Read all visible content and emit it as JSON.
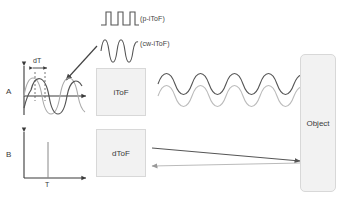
{
  "figure": {
    "type": "diagram",
    "background_color": "#ffffff"
  },
  "legend": {
    "pulsed_waveform_label": "(p-iToF)",
    "continuous_wave_label": "(cw-iToF)",
    "waveform_stroke": "#555555"
  },
  "panels": [
    {
      "id": "panel-a",
      "axis_label": "A",
      "annotation": "dT",
      "description": "Emitted and phase-shifted received sine waves",
      "emitted_stroke": "#aaaaaa",
      "received_stroke": "#555555"
    },
    {
      "id": "panel-b",
      "axis_label": "B",
      "annotation": "T",
      "description": "Single returned light pulse arriving after delay T",
      "impulse_stroke": "#888888"
    }
  ],
  "blocks": [
    {
      "id": "itof",
      "label": "iToF",
      "fill": "#f2f2f2",
      "border": "#d8d8d8"
    },
    {
      "id": "dtof",
      "label": "dToF",
      "fill": "#f2f2f2",
      "border": "#d8d8d8"
    },
    {
      "id": "object",
      "label": "Object",
      "fill": "#f2f2f2",
      "border": "#d8d8d8"
    }
  ],
  "paths": {
    "itof_outgoing_label": "modulated wave to object",
    "itof_returning_label": "reflected wave from object",
    "dtof_outgoing_label": "pulse to object",
    "dtof_returning_label": "pulse reflected from object",
    "callout_label": "waveform detail pointer",
    "outgoing_stroke": "#555555",
    "returning_stroke": "#bbbbbb"
  }
}
